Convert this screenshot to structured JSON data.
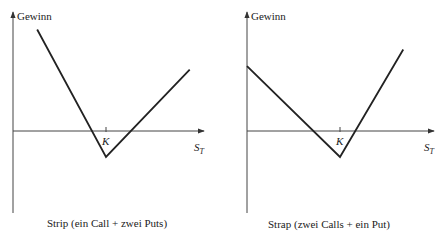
{
  "chart_data": [
    {
      "type": "line",
      "title": "Strip (ein Call + zwei Puts)",
      "ylabel": "Gewinn",
      "xlabel": "S",
      "xlabel_sub": "T",
      "strike_label": "K",
      "description": "Payoff profile: slope -2 below strike, slope +1 above strike",
      "xlim": [
        0,
        1
      ],
      "ylim": [
        -1,
        1
      ],
      "strike": 0.5,
      "points": [
        {
          "x": 0.13,
          "y": 0.86
        },
        {
          "x": 0.5,
          "y": -0.22
        },
        {
          "x": 0.95,
          "y": 0.52
        }
      ],
      "grid": false
    },
    {
      "type": "line",
      "title": "Strap (zwei Calls + ein Put)",
      "ylabel": "Gewinn",
      "xlabel": "S",
      "xlabel_sub": "T",
      "strike_label": "K",
      "description": "Payoff profile: slope -1 below strike, slope +2 above strike",
      "xlim": [
        0,
        1
      ],
      "ylim": [
        -1,
        1
      ],
      "strike": 0.5,
      "points": [
        {
          "x": 0.0,
          "y": 0.55
        },
        {
          "x": 0.5,
          "y": -0.22
        },
        {
          "x": 0.84,
          "y": 0.69
        }
      ],
      "grid": false
    }
  ]
}
